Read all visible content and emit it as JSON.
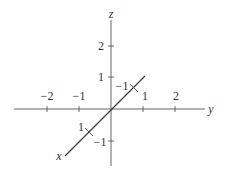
{
  "diagram": {
    "title": "",
    "axes": {
      "x": {
        "label": "x",
        "ticks": [
          {
            "value": 1,
            "label": "1"
          },
          {
            "value": -1,
            "label": "−1"
          }
        ]
      },
      "y": {
        "label": "y",
        "ticks": [
          {
            "value": -2,
            "label": "−2"
          },
          {
            "value": -1,
            "label": "−1"
          },
          {
            "value": 1,
            "label": "1"
          },
          {
            "value": 2,
            "label": "2"
          }
        ]
      },
      "z": {
        "label": "z",
        "ticks": [
          {
            "value": 2,
            "label": "2"
          },
          {
            "value": 1,
            "label": "1"
          },
          {
            "value": -1,
            "label": "−1"
          }
        ]
      }
    }
  }
}
